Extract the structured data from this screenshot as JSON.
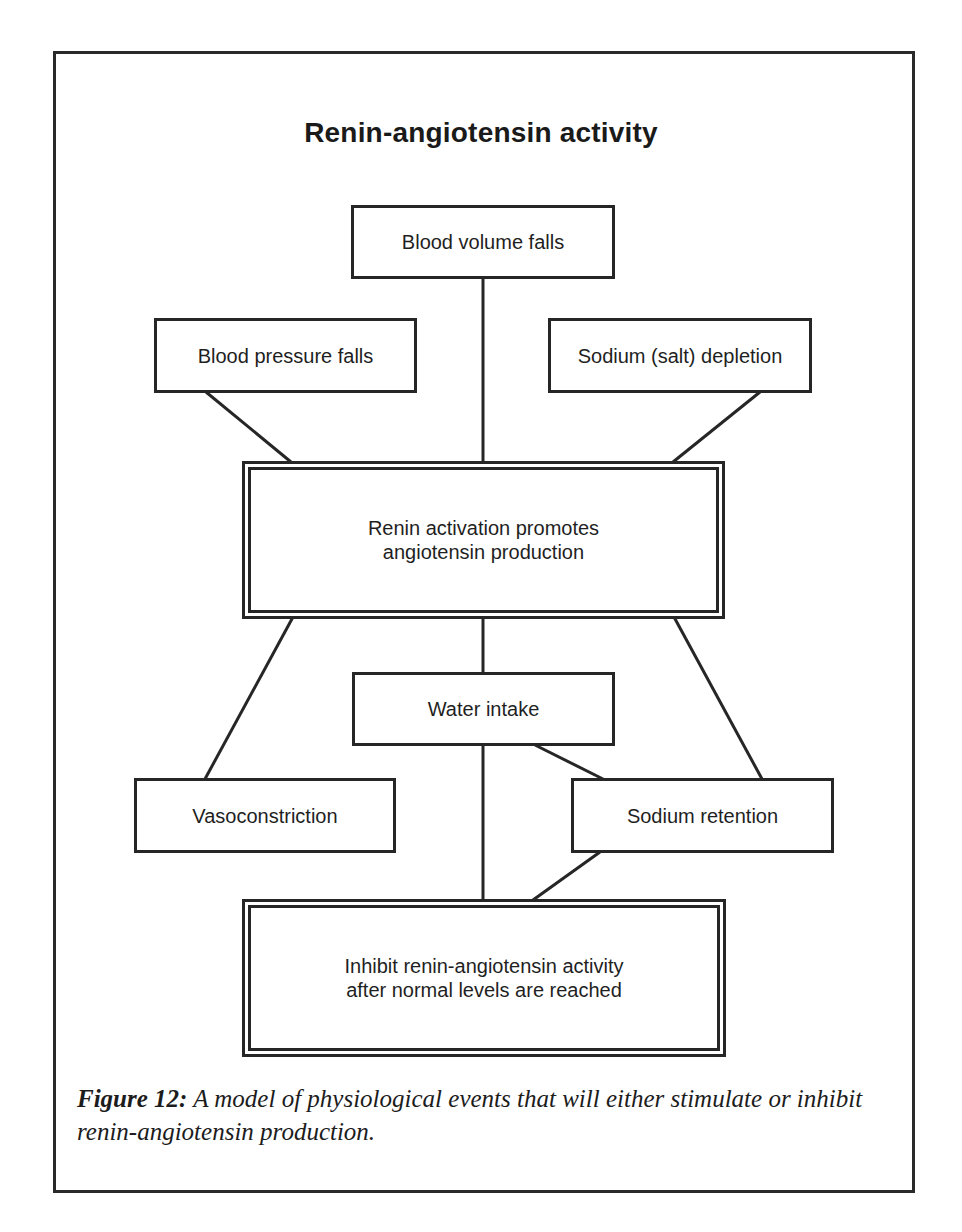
{
  "title": "Renin-angiotensin activity",
  "nodes": {
    "blood_volume": {
      "label": "Blood volume falls"
    },
    "blood_pressure": {
      "label": "Blood pressure falls"
    },
    "sodium_depletion": {
      "label": "Sodium (salt) depletion"
    },
    "renin_activation": {
      "lines": [
        "Renin activation promotes",
        "angiotensin production"
      ]
    },
    "water_intake": {
      "label": "Water intake"
    },
    "vasoconstriction": {
      "label": "Vasoconstriction"
    },
    "sodium_retention": {
      "label": "Sodium retention"
    },
    "inhibit": {
      "lines": [
        "Inhibit renin-angiotensin activity",
        "after normal levels are reached"
      ]
    }
  },
  "edges": [
    {
      "from": "blood_volume",
      "to": "renin_activation"
    },
    {
      "from": "blood_pressure",
      "to": "renin_activation"
    },
    {
      "from": "sodium_depletion",
      "to": "renin_activation"
    },
    {
      "from": "renin_activation",
      "to": "vasoconstriction"
    },
    {
      "from": "renin_activation",
      "to": "water_intake"
    },
    {
      "from": "renin_activation",
      "to": "sodium_retention"
    },
    {
      "from": "water_intake",
      "to": "sodium_retention"
    },
    {
      "from": "water_intake",
      "to": "inhibit"
    },
    {
      "from": "sodium_retention",
      "to": "inhibit"
    }
  ],
  "caption": {
    "label": "Figure 12:",
    "text": " A model of physiological events that will either stimulate or inhibit renin-angiotensin production."
  }
}
